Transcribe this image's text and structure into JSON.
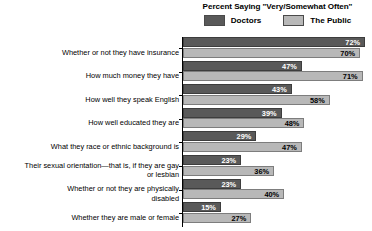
{
  "legend": {
    "title": "Percent Saying \"Very/Somewhat Often\"",
    "series": [
      {
        "key": "doctors",
        "label": "Doctors",
        "color": "#595959"
      },
      {
        "key": "public",
        "label": "The Public",
        "color": "#b8b8b8"
      }
    ]
  },
  "chart_data": {
    "type": "bar",
    "orientation": "horizontal",
    "title": "Percent Saying \"Very/Somewhat Often\"",
    "xlabel": "",
    "ylabel": "",
    "xlim": [
      0,
      72
    ],
    "grid": false,
    "legend_position": "top",
    "categories": [
      "Whether or not they have insurance",
      "How much money they have",
      "How well they speak English",
      "How well educated they are",
      "What they race or ethnic background is",
      "Their sexual orientation—that is, if they are gay\nor lesbian",
      "Whether or not they are physically\ndisabled",
      "Whether they are male or female"
    ],
    "series": [
      {
        "name": "Doctors",
        "color": "#595959",
        "values": [
          72,
          47,
          43,
          39,
          29,
          23,
          23,
          15
        ],
        "labels": [
          "72%",
          "47%",
          "43%",
          "39%",
          "29%",
          "23%",
          "23%",
          "15%"
        ]
      },
      {
        "name": "The Public",
        "color": "#b8b8b8",
        "values": [
          70,
          71,
          58,
          48,
          47,
          36,
          40,
          27
        ],
        "labels": [
          "70%",
          "71%",
          "58%",
          "48%",
          "47%",
          "36%",
          "40%",
          "27%"
        ]
      }
    ]
  }
}
